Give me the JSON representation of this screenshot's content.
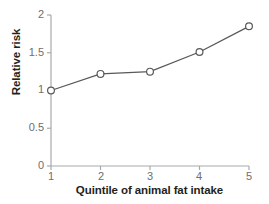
{
  "chart_data": {
    "type": "line",
    "title": "",
    "subtitle": "",
    "xlabel": "Quintile of animal fat intake",
    "ylabel": "Relative risk",
    "categories": [
      1,
      2,
      3,
      4,
      5
    ],
    "values": [
      1.0,
      1.22,
      1.25,
      1.51,
      1.85
    ],
    "series": [
      {
        "name": "Relative risk",
        "values": [
          1.0,
          1.22,
          1.25,
          1.51,
          1.85
        ]
      }
    ],
    "xtick_labels": [
      "1",
      "2",
      "3",
      "4",
      "5"
    ],
    "ytick_labels": [
      "0",
      "0.5",
      "1",
      "1.5",
      "2"
    ],
    "ytick_values": [
      0,
      0.5,
      1,
      1.5,
      2
    ],
    "xlim": [
      1,
      5
    ],
    "ylim": [
      0,
      2
    ],
    "grid": false,
    "legend": false,
    "legend_position": "none",
    "annotations": [],
    "marker": "open-circle",
    "colors": {
      "background": "#ffffff",
      "line": "#58595b",
      "marker_fill": "#ffffff",
      "marker_stroke": "#58595b",
      "axis": "#a7a9ac",
      "tick_label": "#6d6e71",
      "axis_title": "#231f20"
    }
  }
}
